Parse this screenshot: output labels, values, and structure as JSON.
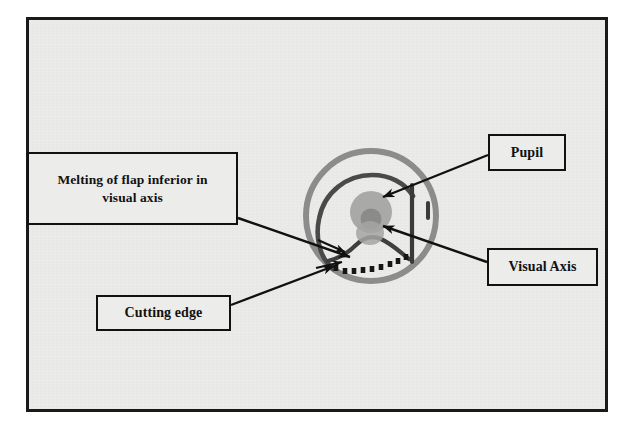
{
  "figure": {
    "caption": "",
    "border_color": "#1a1a1a",
    "paper_color": "#ececeb"
  },
  "callouts": [
    {
      "id": "melting-of-flap",
      "label": "Melting of flap inferior in visual axis",
      "line1": "Melting of flap inferior in",
      "line2": "visual axis",
      "box": {
        "x": 27,
        "y": 152,
        "w": 211,
        "h": 73
      }
    },
    {
      "id": "pupil",
      "label": "Pupil",
      "line1": "Pupil",
      "line2": "",
      "box": {
        "x": 488,
        "y": 134,
        "w": 78,
        "h": 37
      }
    },
    {
      "id": "visual-axis",
      "label": "Visual Axis",
      "line1": "Visual Axis",
      "line2": "",
      "box": {
        "x": 487,
        "y": 248,
        "w": 111,
        "h": 38
      }
    },
    {
      "id": "cutting-edge",
      "label": "Cutting edge",
      "line1": "Cutting edge",
      "line2": "",
      "box": {
        "x": 96,
        "y": 295,
        "w": 135,
        "h": 36
      }
    }
  ],
  "eye_diagram": {
    "center": {
      "x": 371,
      "y": 216
    },
    "limbus_radius": 65,
    "limbus_color": "#8c8c8c",
    "limbus_stroke_width": 6,
    "flap_arc_color": "#4a4a4a",
    "flap_arc_stroke_width": 4.5,
    "pupil_outer_color": "#a9a9a7",
    "pupil_outer_radius": 21,
    "pupil_inner_color": "#8b8b89",
    "pupil_inner_radius": 10,
    "hinge_color": "#3a3a3a",
    "cut_edge_dash_color": "#1a1a1a",
    "arrow_color": "#111111",
    "leader_color": "#111111",
    "parts": [
      "limbus-circle",
      "flap-arc",
      "pupil",
      "melting-zone",
      "hinge-line",
      "hinge-tick",
      "cutting-edge-dashes"
    ]
  },
  "leader_lines": [
    {
      "from": "melting-of-flap",
      "to": "flap-melt-zone"
    },
    {
      "from": "pupil",
      "to": "pupil"
    },
    {
      "from": "visual-axis",
      "to": "visual-axis-point"
    },
    {
      "from": "cutting-edge",
      "to": "cutting-edge-dashes"
    }
  ]
}
